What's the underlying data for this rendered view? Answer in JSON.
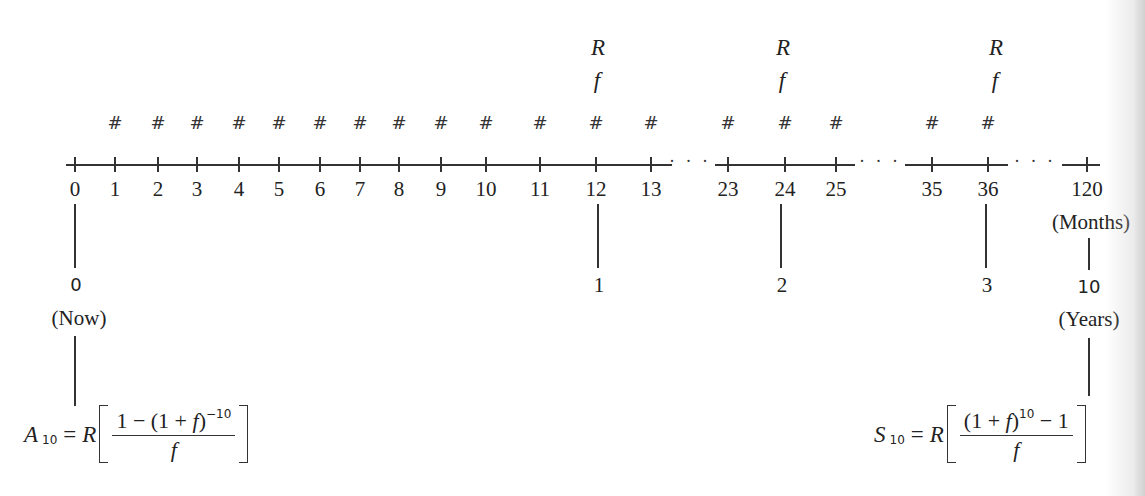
{
  "diagram": {
    "type": "timeline",
    "title": "",
    "axis": {
      "unit_label": "(Months)",
      "segments": [
        {
          "x1": 66,
          "x2": 672
        },
        {
          "x1": 715,
          "x2": 855
        },
        {
          "x1": 905,
          "x2": 1008
        },
        {
          "x1": 1062,
          "x2": 1100
        }
      ],
      "ellipses": [
        {
          "x": 690,
          "text": "· · ·"
        },
        {
          "x": 880,
          "text": "· · ·"
        },
        {
          "x": 1035,
          "text": "· · ·"
        }
      ],
      "ticks": [
        {
          "label": "0",
          "x": 75,
          "hash": false
        },
        {
          "label": "1",
          "x": 115,
          "hash": true
        },
        {
          "label": "2",
          "x": 158,
          "hash": true
        },
        {
          "label": "3",
          "x": 197,
          "hash": true
        },
        {
          "label": "4",
          "x": 239,
          "hash": true
        },
        {
          "label": "5",
          "x": 279,
          "hash": true
        },
        {
          "label": "6",
          "x": 320,
          "hash": true
        },
        {
          "label": "7",
          "x": 360,
          "hash": true
        },
        {
          "label": "8",
          "x": 399,
          "hash": true
        },
        {
          "label": "9",
          "x": 441,
          "hash": true
        },
        {
          "label": "10",
          "x": 486,
          "hash": true
        },
        {
          "label": "11",
          "x": 540,
          "hash": true
        },
        {
          "label": "12",
          "x": 596,
          "hash": true
        },
        {
          "label": "13",
          "x": 651,
          "hash": true
        },
        {
          "label": "23",
          "x": 728,
          "hash": true
        },
        {
          "label": "24",
          "x": 785,
          "hash": true
        },
        {
          "label": "25",
          "x": 836,
          "hash": true
        },
        {
          "label": "35",
          "x": 932,
          "hash": true
        },
        {
          "label": "36",
          "x": 988,
          "hash": true
        },
        {
          "label": "120",
          "x": 1087,
          "hash": false
        }
      ],
      "hash_symbol": "#"
    },
    "rate_markers": [
      {
        "x": 598,
        "top": "R",
        "bottom": "f"
      },
      {
        "x": 783,
        "top": "R",
        "bottom": "f"
      },
      {
        "x": 996,
        "top": "R",
        "bottom": "f"
      }
    ],
    "year_markers": [
      {
        "x": 598,
        "label": "1"
      },
      {
        "x": 781,
        "label": "2"
      },
      {
        "x": 986,
        "label": "3"
      }
    ],
    "start": {
      "year_label": "0",
      "caption": "(Now)"
    },
    "end": {
      "year_label": "10",
      "caption": "(Years)"
    },
    "formulas": {
      "present_value": {
        "lhs": "A",
        "lhs_sub": "10",
        "eq": "=",
        "coef": "R",
        "numerator_a": "1 − (1 + ",
        "numerator_f": "f",
        "numerator_b": ")",
        "numerator_exp": "−10",
        "denominator": "f"
      },
      "future_value": {
        "lhs": "S",
        "lhs_sub": "10",
        "eq": "=",
        "coef": "R",
        "numerator_a": "(1 + ",
        "numerator_f": "f",
        "numerator_b": ")",
        "numerator_exp": "10",
        "numerator_c": " − 1",
        "denominator": "f"
      }
    }
  }
}
